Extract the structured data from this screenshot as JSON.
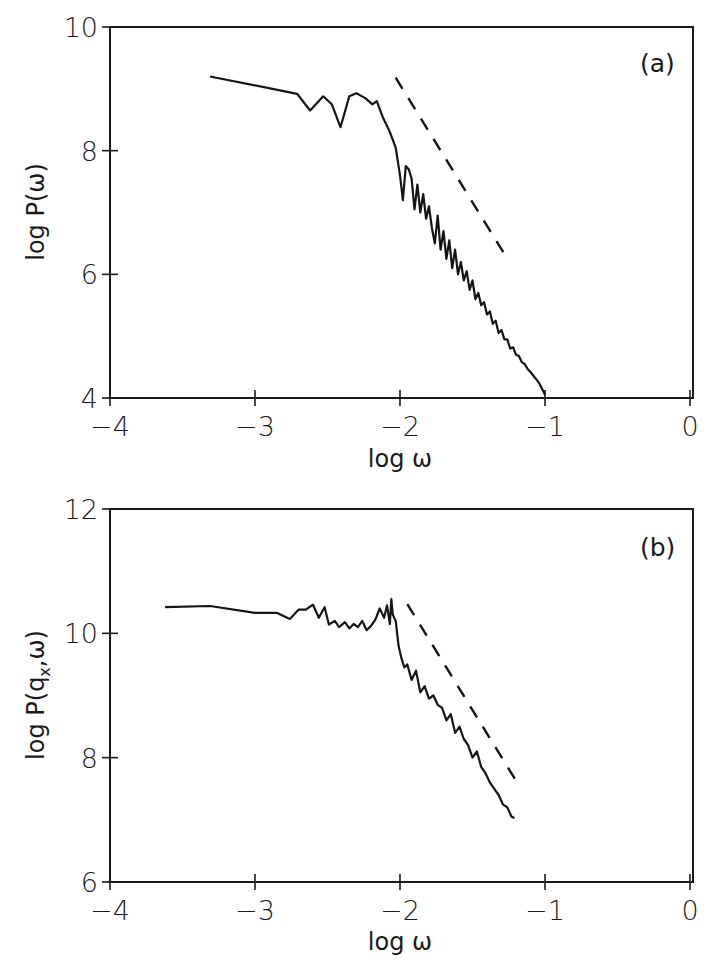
{
  "chart_data": [
    {
      "type": "line",
      "panel_label": "(a)",
      "xlabel": "log ω",
      "ylabel": "log P(ω)",
      "xlim": [
        -4,
        0
      ],
      "ylim": [
        4,
        10
      ],
      "x_ticks": [
        "−4",
        "−3",
        "−2",
        "−1",
        "0"
      ],
      "y_ticks": [
        "4",
        "6",
        "8",
        "10"
      ],
      "grid": false,
      "series": [
        {
          "name": "spectrum",
          "style": "solid",
          "x": [
            -3.31,
            -2.71,
            -2.62,
            -2.53,
            -2.47,
            -2.41,
            -2.35,
            -2.3,
            -2.24,
            -2.19,
            -2.16,
            -2.12,
            -2.07,
            -2.03,
            -2.0,
            -1.98,
            -1.96,
            -1.94,
            -1.92,
            -1.9,
            -1.88,
            -1.86,
            -1.84,
            -1.82,
            -1.8,
            -1.78,
            -1.76,
            -1.74,
            -1.72,
            -1.7,
            -1.68,
            -1.66,
            -1.64,
            -1.62,
            -1.6,
            -1.58,
            -1.56,
            -1.54,
            -1.52,
            -1.5,
            -1.48,
            -1.46,
            -1.44,
            -1.42,
            -1.4,
            -1.38,
            -1.36,
            -1.34,
            -1.32,
            -1.3,
            -1.28,
            -1.26,
            -1.24,
            -1.22,
            -1.2,
            -1.18,
            -1.16,
            -1.14,
            -1.12,
            -1.1,
            -1.08,
            -1.06,
            -1.04,
            -1.02,
            -1.0
          ],
          "y": [
            9.2,
            8.92,
            8.65,
            8.88,
            8.75,
            8.38,
            8.88,
            8.93,
            8.85,
            8.75,
            8.8,
            8.55,
            8.3,
            8.05,
            7.6,
            7.2,
            7.75,
            7.7,
            7.55,
            7.05,
            7.45,
            7.0,
            7.3,
            6.9,
            7.1,
            6.75,
            6.5,
            6.95,
            6.4,
            6.7,
            6.25,
            6.55,
            6.1,
            6.4,
            6.0,
            6.2,
            5.9,
            6.05,
            5.75,
            5.9,
            5.6,
            5.7,
            5.5,
            5.55,
            5.35,
            5.4,
            5.2,
            5.25,
            5.05,
            5.1,
            4.95,
            4.95,
            4.8,
            4.82,
            4.7,
            4.68,
            4.58,
            4.55,
            4.47,
            4.42,
            4.36,
            4.3,
            4.24,
            4.15,
            4.05
          ]
        },
        {
          "name": "reference slope",
          "style": "dashed",
          "x": [
            -2.03,
            -1.27
          ],
          "y": [
            9.18,
            6.29
          ]
        }
      ]
    },
    {
      "type": "line",
      "panel_label": "(b)",
      "xlabel": "log ω",
      "ylabel": "log P(q_x, ω)",
      "ylabel_parts": {
        "pre": "log P(q",
        "sub": "x",
        "post": ",ω)"
      },
      "xlim": [
        -4,
        0
      ],
      "ylim": [
        6,
        12
      ],
      "x_ticks": [
        "−4",
        "−3",
        "−2",
        "−1",
        "0"
      ],
      "y_ticks": [
        "6",
        "8",
        "10",
        "12"
      ],
      "grid": false,
      "series": [
        {
          "name": "spectrum",
          "style": "solid",
          "x": [
            -3.62,
            -3.31,
            -3.0,
            -2.85,
            -2.76,
            -2.7,
            -2.65,
            -2.6,
            -2.56,
            -2.52,
            -2.49,
            -2.45,
            -2.42,
            -2.38,
            -2.35,
            -2.32,
            -2.29,
            -2.26,
            -2.23,
            -2.2,
            -2.17,
            -2.14,
            -2.11,
            -2.09,
            -2.07,
            -2.06,
            -2.05,
            -2.03,
            -2.01,
            -1.99,
            -1.97,
            -1.95,
            -1.92,
            -1.89,
            -1.86,
            -1.83,
            -1.8,
            -1.77,
            -1.74,
            -1.71,
            -1.68,
            -1.65,
            -1.62,
            -1.59,
            -1.56,
            -1.53,
            -1.5,
            -1.47,
            -1.44,
            -1.41,
            -1.38,
            -1.35,
            -1.32,
            -1.29,
            -1.26,
            -1.23,
            -1.21
          ],
          "y": [
            10.42,
            10.44,
            10.33,
            10.33,
            10.23,
            10.38,
            10.38,
            10.46,
            10.25,
            10.42,
            10.14,
            10.2,
            10.1,
            10.18,
            10.08,
            10.15,
            10.1,
            10.2,
            10.05,
            10.12,
            10.22,
            10.4,
            10.25,
            10.45,
            10.15,
            10.55,
            10.3,
            10.2,
            9.8,
            9.6,
            9.45,
            9.5,
            9.25,
            9.4,
            9.05,
            9.15,
            8.95,
            9.0,
            8.85,
            8.8,
            8.6,
            8.7,
            8.4,
            8.5,
            8.3,
            8.2,
            8.0,
            8.1,
            7.85,
            7.75,
            7.6,
            7.5,
            7.4,
            7.25,
            7.2,
            7.05,
            7.03
          ]
        },
        {
          "name": "reference slope",
          "style": "dashed",
          "x": [
            -1.95,
            -1.2
          ],
          "y": [
            10.47,
            7.63
          ]
        }
      ]
    }
  ]
}
